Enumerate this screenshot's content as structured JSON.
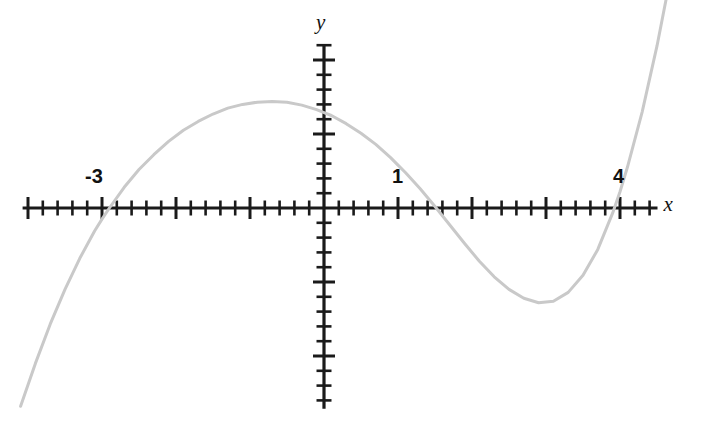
{
  "figure": {
    "background_color": "#ffffff",
    "axis_color": "#1a1a1a",
    "curve_color": "#c9c9c9"
  },
  "axis_labels": {
    "x": "x",
    "y": "y"
  },
  "tick_labels": [
    {
      "text": "-3",
      "value": -3
    },
    {
      "text": "1",
      "value": 1
    },
    {
      "text": "4",
      "value": 4
    }
  ],
  "chart_data": {
    "type": "line",
    "title": "",
    "xlabel": "x",
    "ylabel": "y",
    "grid": false,
    "legend": "none",
    "curve_color": "#c9c9c9",
    "xlim": [
      -4.1,
      4.75
    ],
    "ylim": [
      -2.7,
      2.25
    ],
    "x_tick_interval": 1,
    "x_minor_tick_interval": 0.2,
    "y_tick_interval": 1,
    "y_minor_tick_interval": 0.2,
    "x_axis_tick_labels": [
      "-3",
      "1",
      "4"
    ],
    "y_axis_tick_labels": [],
    "roots": [
      -3,
      1,
      4
    ],
    "y_intercept": 0.55,
    "local_maximum": {
      "x": -1.25,
      "y": 1.92
    },
    "local_minimum": {
      "x": 2.57,
      "y": -1.19
    },
    "equation": "y = 0.0482 (x + 3)(x - 1)(x - 4)",
    "x": [
      -4.1,
      -3.9,
      -3.7,
      -3.5,
      -3.3,
      -3.1,
      -3.0,
      -2.9,
      -2.7,
      -2.5,
      -2.3,
      -2.1,
      -1.9,
      -1.7,
      -1.5,
      -1.3,
      -1.1,
      -0.9,
      -0.7,
      -0.5,
      -0.3,
      -0.1,
      0.0,
      0.1,
      0.3,
      0.5,
      0.7,
      0.9,
      1.0,
      1.1,
      1.3,
      1.5,
      1.7,
      1.9,
      2.1,
      2.3,
      2.5,
      2.7,
      2.9,
      3.1,
      3.3,
      3.5,
      3.7,
      3.9,
      4.0,
      4.1,
      4.3,
      4.5,
      4.75
    ],
    "y": [
      -2.68,
      -2.1,
      -1.57,
      -1.1,
      -0.68,
      -0.31,
      -0.15,
      0.0,
      0.28,
      0.52,
      0.72,
      0.9,
      1.05,
      1.17,
      1.27,
      1.35,
      1.4,
      1.43,
      1.44,
      1.43,
      1.39,
      1.33,
      1.29,
      1.25,
      1.14,
      1.01,
      0.86,
      0.68,
      0.58,
      0.48,
      0.26,
      0.02,
      -0.23,
      -0.48,
      -0.72,
      -0.93,
      -1.1,
      -1.22,
      -1.28,
      -1.26,
      -1.14,
      -0.91,
      -0.56,
      -0.07,
      0.22,
      0.55,
      1.3,
      2.19,
      3.47
    ]
  }
}
